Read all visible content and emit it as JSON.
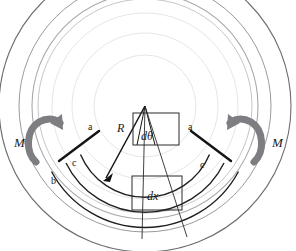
{
  "figure": {
    "background_color": "#ffffff",
    "width": 296,
    "height": 251,
    "labels": {
      "moment_left": "M",
      "moment_right": "M",
      "radius": "R",
      "angle_element": "dθ",
      "length_element": "dx",
      "outer_fiber_left": "a",
      "outer_fiber_right": "a",
      "neutral_axis_left": "b",
      "centroid_left": "c",
      "centroid_right": "c"
    },
    "colors": {
      "faint_arc": "#e3e3e6",
      "light_arc": "#bfbfc4",
      "mid_arc": "#8a8a90",
      "dark_line": "#1a1a1a",
      "thin_line": "#4a4a4a",
      "moment_arrow": "#77777c",
      "text": "#1a1a1a"
    },
    "geometry": {
      "center_x": 145,
      "center_y": 106,
      "arc_radii": [
        93,
        73,
        51,
        107,
        126,
        146,
        166,
        186,
        199
      ],
      "label_notes": "concentric arcs about apex; radial thick lines mark a-c-b fibers"
    }
  }
}
